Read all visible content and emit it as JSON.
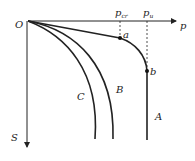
{
  "diagram": {
    "origin_label": "O",
    "x_axis_label": "p",
    "y_axis_label": "S",
    "critical_load_label": "p",
    "critical_load_sub": "cr",
    "ultimate_load_label": "p",
    "ultimate_load_sub": "u",
    "point_a_label": "a",
    "point_b_label": "b",
    "curves": [
      {
        "id": "A",
        "label": "A"
      },
      {
        "id": "B",
        "label": "B"
      },
      {
        "id": "C",
        "label": "C"
      }
    ]
  }
}
